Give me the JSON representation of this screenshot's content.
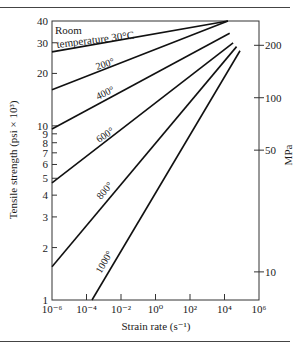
{
  "chart_data": {
    "type": "line",
    "title": "",
    "xlabel": "Strain rate (s⁻¹)",
    "ylabel": "Tensile strength (psi × 10³)",
    "ylabel_right": "MPa",
    "x_scale": "log",
    "y_scale": "log",
    "xlim": [
      1e-06,
      1000000.0
    ],
    "ylim": [
      1,
      40
    ],
    "x_ticks": [
      "10⁻⁶",
      "10⁻⁴",
      "10⁻²",
      "10⁰",
      "10²",
      "10⁴",
      "10⁶"
    ],
    "x_tick_exponents": [
      -6,
      -4,
      -2,
      0,
      2,
      4,
      6
    ],
    "y_ticks": [
      1,
      2,
      3,
      4,
      5,
      6,
      7,
      8,
      9,
      10,
      20,
      30,
      40
    ],
    "y_ticks_right_mpa": [
      10,
      50,
      100,
      200
    ],
    "grid": false,
    "series": [
      {
        "name": "Room temperature 30°C",
        "label": "Room temperature 30°C",
        "x_log": [
          -6,
          4.2
        ],
        "y": [
          26.6,
          40
        ]
      },
      {
        "name": "200°",
        "label": "200°",
        "x_log": [
          -6,
          4.2
        ],
        "y": [
          16.1,
          40
        ]
      },
      {
        "name": "400°",
        "label": "400°",
        "x_log": [
          -6,
          4.3
        ],
        "y": [
          9.6,
          34
        ]
      },
      {
        "name": "600°",
        "label": "600°",
        "x_log": [
          -6,
          4.5
        ],
        "y": [
          4.7,
          30
        ]
      },
      {
        "name": "800°",
        "label": "800°",
        "x_log": [
          -6,
          4.7
        ],
        "y": [
          1.55,
          28.5
        ]
      },
      {
        "name": "1000°",
        "label": "1000°",
        "x_log": [
          -3.68,
          4.9
        ],
        "y": [
          1,
          27
        ]
      }
    ]
  },
  "labels": {
    "room_line1": "Room",
    "room_line2": "temperature 30°C",
    "t200": "200°",
    "t400": "400°",
    "t600": "600°",
    "t800": "800°",
    "t1000": "1000°"
  }
}
